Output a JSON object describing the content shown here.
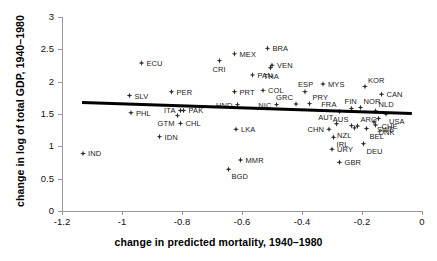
{
  "chart_data": {
    "type": "scatter",
    "title": "",
    "xlabel": "change in predicted mortality, 1940–1980",
    "ylabel": "change in log of total GDP, 1940–1980",
    "xlim": [
      -1.2,
      0
    ],
    "ylim": [
      0,
      3
    ],
    "xticks": [
      "-1.2",
      "-1",
      "-0.8",
      "-0.6",
      "-0.4",
      "-0.2",
      "0"
    ],
    "xtick_values": [
      -1.2,
      -1.0,
      -0.8,
      -0.6,
      -0.4,
      -0.2,
      0
    ],
    "yticks": [
      "0",
      "0.5",
      "1",
      "1.5",
      "2",
      "2.5",
      "3"
    ],
    "ytick_values": [
      0,
      0.5,
      1.0,
      1.5,
      2.0,
      2.5,
      3.0
    ],
    "grid": false,
    "legend": false,
    "marker": "diamond",
    "marker_color": "#2b2b2b",
    "fit_line": {
      "label": "regression line",
      "color": "#000000",
      "x_start": -1.135,
      "y_start": 1.675,
      "x_end": -0.035,
      "y_end": 1.505
    },
    "points": [
      {
        "label": "IND",
        "x": -1.13,
        "y": 0.89,
        "pos": "r"
      },
      {
        "label": "PHL",
        "x": -0.97,
        "y": 1.52,
        "pos": "r"
      },
      {
        "label": "SLV",
        "x": -0.975,
        "y": 1.785,
        "pos": "r"
      },
      {
        "label": "ECU",
        "x": -0.935,
        "y": 2.29,
        "pos": "r"
      },
      {
        "label": "IDN",
        "x": -0.875,
        "y": 1.15,
        "pos": "r"
      },
      {
        "label": "PER",
        "x": -0.835,
        "y": 1.845,
        "pos": "r"
      },
      {
        "label": "GTM",
        "x": -0.815,
        "y": 1.475,
        "pos": "bl"
      },
      {
        "label": "ITA",
        "x": -0.805,
        "y": 1.555,
        "pos": "l"
      },
      {
        "label": "PAK",
        "x": -0.795,
        "y": 1.555,
        "pos": "r"
      },
      {
        "label": "CHL",
        "x": -0.805,
        "y": 1.355,
        "pos": "r"
      },
      {
        "label": "CRI",
        "x": -0.675,
        "y": 2.325,
        "pos": "b"
      },
      {
        "label": "BGD",
        "x": -0.645,
        "y": 0.645,
        "pos": "br"
      },
      {
        "label": "MEX",
        "x": -0.625,
        "y": 2.43,
        "pos": "r"
      },
      {
        "label": "PRT",
        "x": -0.625,
        "y": 1.845,
        "pos": "r"
      },
      {
        "label": "HND",
        "x": -0.615,
        "y": 1.645,
        "pos": "l"
      },
      {
        "label": "LKA",
        "x": -0.62,
        "y": 1.265,
        "pos": "r"
      },
      {
        "label": "MMR",
        "x": -0.605,
        "y": 0.79,
        "pos": "r"
      },
      {
        "label": "PAN",
        "x": -0.565,
        "y": 2.105,
        "pos": "r"
      },
      {
        "label": "COL",
        "x": -0.53,
        "y": 1.865,
        "pos": "r"
      },
      {
        "label": "BRA",
        "x": -0.515,
        "y": 2.515,
        "pos": "r"
      },
      {
        "label": "VEN",
        "x": -0.5,
        "y": 2.255,
        "pos": "r"
      },
      {
        "label": "THA",
        "x": -0.505,
        "y": 2.215,
        "pos": "b"
      },
      {
        "label": "NIC",
        "x": -0.485,
        "y": 1.645,
        "pos": "l"
      },
      {
        "label": "GRC",
        "x": -0.42,
        "y": 1.655,
        "pos": "tl"
      },
      {
        "label": "PRY",
        "x": -0.375,
        "y": 1.66,
        "pos": "tr"
      },
      {
        "label": "ESP",
        "x": -0.39,
        "y": 1.845,
        "pos": "t"
      },
      {
        "label": "MYS",
        "x": -0.33,
        "y": 1.965,
        "pos": "r"
      },
      {
        "label": "CHN",
        "x": -0.31,
        "y": 1.265,
        "pos": "l"
      },
      {
        "label": "URY",
        "x": -0.3,
        "y": 0.955,
        "pos": "r"
      },
      {
        "label": "IRL",
        "x": -0.295,
        "y": 1.14,
        "pos": "br"
      },
      {
        "label": "AUT",
        "x": -0.285,
        "y": 1.35,
        "pos": "tl"
      },
      {
        "label": "FRA",
        "x": -0.275,
        "y": 1.54,
        "pos": "tl"
      },
      {
        "label": "GBR",
        "x": -0.275,
        "y": 0.755,
        "pos": "r"
      },
      {
        "label": "AUS",
        "x": -0.235,
        "y": 1.32,
        "pos": "tl"
      },
      {
        "label": "FIN",
        "x": -0.235,
        "y": 1.585,
        "pos": "t"
      },
      {
        "label": "NZL",
        "x": -0.225,
        "y": 1.285,
        "pos": "bl"
      },
      {
        "label": "ARG",
        "x": -0.215,
        "y": 1.315,
        "pos": "tr"
      },
      {
        "label": "NOR",
        "x": -0.205,
        "y": 1.6,
        "pos": "tr"
      },
      {
        "label": "KOR",
        "x": -0.19,
        "y": 1.925,
        "pos": "tr"
      },
      {
        "label": "DEU",
        "x": -0.195,
        "y": 1.04,
        "pos": "br"
      },
      {
        "label": "BEL",
        "x": -0.185,
        "y": 1.275,
        "pos": "br"
      },
      {
        "label": "SWE",
        "x": -0.16,
        "y": 1.375,
        "pos": "br"
      },
      {
        "label": "NLD",
        "x": -0.155,
        "y": 1.545,
        "pos": "tr"
      },
      {
        "label": "DNK",
        "x": -0.155,
        "y": 1.33,
        "pos": "br"
      },
      {
        "label": "CHE",
        "x": -0.145,
        "y": 1.43,
        "pos": "br"
      },
      {
        "label": "CAN",
        "x": -0.135,
        "y": 1.805,
        "pos": "r"
      },
      {
        "label": "USA",
        "x": -0.12,
        "y": 1.5,
        "pos": "br"
      }
    ]
  }
}
